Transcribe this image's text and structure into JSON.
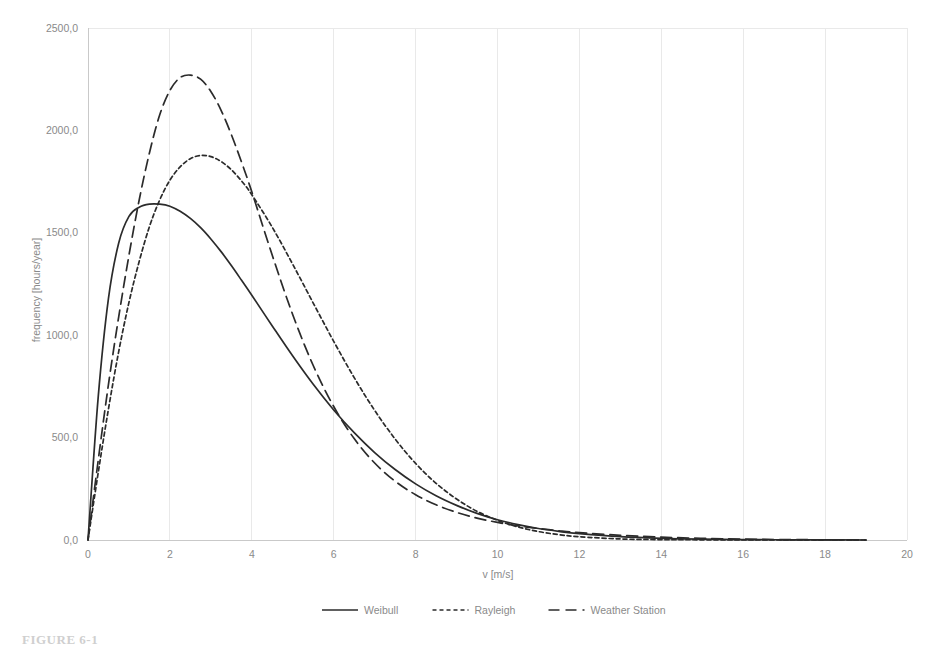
{
  "figure": {
    "caption": "FIGURE 6-1"
  },
  "chart_data": {
    "type": "line",
    "title": "",
    "xlabel": "v [m/s]",
    "ylabel": "frequency [hours/year]",
    "xlim": [
      0,
      20
    ],
    "ylim": [
      0,
      2500
    ],
    "xticks": [
      "0",
      "2",
      "4",
      "6",
      "8",
      "10",
      "12",
      "14",
      "16",
      "18",
      "20"
    ],
    "xtick_values": [
      0,
      2,
      4,
      6,
      8,
      10,
      12,
      14,
      16,
      18,
      20
    ],
    "yticks": [
      "0,0",
      "500,0",
      "1000,0",
      "1500,0",
      "2000,0",
      "2500,0"
    ],
    "ytick_values": [
      0,
      500,
      1000,
      1500,
      2000,
      2500
    ],
    "grid": "vertical-and-top",
    "legend_position": "bottom-center",
    "x": [
      0,
      0.25,
      0.5,
      0.75,
      1,
      1.25,
      1.5,
      1.75,
      2,
      2.25,
      2.5,
      2.75,
      3,
      3.25,
      3.5,
      3.75,
      4,
      4.5,
      5,
      5.5,
      6,
      6.5,
      7,
      7.5,
      8,
      8.5,
      9,
      9.5,
      10,
      10.5,
      11,
      11.5,
      12,
      13,
      14,
      15,
      16,
      17,
      18,
      19
    ],
    "series": [
      {
        "name": "Weibull",
        "style": "solid",
        "values": [
          0,
          700,
          1180,
          1450,
          1580,
          1625,
          1640,
          1640,
          1630,
          1605,
          1570,
          1525,
          1470,
          1408,
          1340,
          1268,
          1195,
          1045,
          898,
          760,
          635,
          524,
          427,
          344,
          274,
          216,
          169,
          130,
          99,
          75,
          56,
          42,
          31,
          16,
          8,
          4,
          2,
          1,
          0.5,
          0
        ]
      },
      {
        "name": "Rayleigh",
        "style": "dotted",
        "values": [
          0,
          330,
          640,
          920,
          1160,
          1360,
          1530,
          1660,
          1757,
          1822,
          1862,
          1878,
          1872,
          1848,
          1808,
          1753,
          1686,
          1527,
          1346,
          1157,
          970,
          793,
          633,
          493,
          374,
          277,
          200,
          140,
          96,
          64,
          41,
          26,
          16,
          5,
          2,
          1,
          0.4,
          0.2,
          0.1,
          0
        ]
      },
      {
        "name": "Weather Station",
        "style": "dashed",
        "values": [
          0,
          390,
          760,
          1090,
          1390,
          1660,
          1890,
          2075,
          2195,
          2258,
          2270,
          2250,
          2190,
          2098,
          1980,
          1845,
          1700,
          1390,
          1100,
          852,
          652,
          495,
          376,
          287,
          221,
          172,
          135,
          107,
          86,
          69,
          56,
          45,
          36,
          23,
          14,
          8,
          4,
          2,
          1,
          0
        ]
      }
    ]
  },
  "axes": {
    "y_title": "frequency [hours/year]",
    "x_title": "v [m/s]"
  },
  "legend": {
    "items": [
      {
        "label": "Weibull",
        "style": "solid"
      },
      {
        "label": "Rayleigh",
        "style": "dotted"
      },
      {
        "label": "Weather Station",
        "style": "dashed"
      }
    ]
  }
}
